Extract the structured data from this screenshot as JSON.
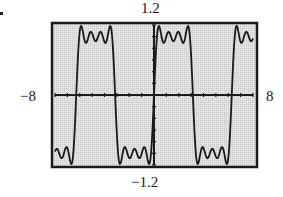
{
  "labels": {
    "ymax": "1.2",
    "ymin": "−1.2",
    "xmin": "−8",
    "xmax": "8"
  },
  "colors": {
    "screen_background": "#d9d9d9",
    "frame": "#1a1a1a",
    "curve": "#1a1a1a",
    "axes": "#1a1a1a"
  },
  "chart_data": {
    "type": "line",
    "title": "",
    "xlabel": "",
    "ylabel": "",
    "xlim": [
      -8,
      8
    ],
    "ylim": [
      -1.2,
      1.2
    ],
    "xscale_tick": 1,
    "yscale_tick": 0.2,
    "grid": false,
    "legend": null,
    "series": [
      {
        "name": "f(x) = (4/π)[sin x + sin 3x/3 + sin 5x/5 + sin 7x/7]",
        "harmonics": [
          1,
          3,
          5,
          7
        ],
        "coefficient": 1.2732,
        "x_zero_crossings": [
          -6.28,
          -3.14,
          0,
          3.14,
          6.28
        ],
        "approx_plateau_value": 1.0,
        "approx_peak_value": 1.1,
        "sample_points": [
          {
            "x": -8,
            "y": -0.85
          },
          {
            "x": -7,
            "y": -1.05
          },
          {
            "x": -6.28,
            "y": 0
          },
          {
            "x": -5,
            "y": 1.0
          },
          {
            "x": -4,
            "y": 0.9
          },
          {
            "x": -3.14,
            "y": 0
          },
          {
            "x": -2,
            "y": -0.95
          },
          {
            "x": -1,
            "y": -1.05
          },
          {
            "x": 0,
            "y": 0
          },
          {
            "x": 1,
            "y": 1.05
          },
          {
            "x": 2,
            "y": 0.95
          },
          {
            "x": 3.14,
            "y": 0
          },
          {
            "x": 4,
            "y": -0.9
          },
          {
            "x": 5,
            "y": -1.0
          },
          {
            "x": 6.28,
            "y": 0
          },
          {
            "x": 7,
            "y": 1.05
          },
          {
            "x": 8,
            "y": 0.85
          }
        ]
      }
    ]
  }
}
